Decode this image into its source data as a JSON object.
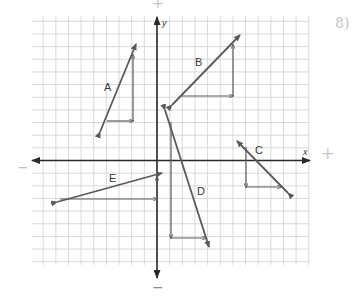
{
  "worksheet": {
    "grid": {
      "x_min": 32,
      "x_max": 309,
      "y_min": 16,
      "y_max": 265,
      "origin_px": [
        157,
        160.5
      ],
      "cell_px": 12.65,
      "color": "#cfcfcf"
    },
    "axes": {
      "x_label": "x",
      "y_label": "y",
      "color": "#2a2a2a"
    },
    "annotations": {
      "top_plus": "+",
      "bottom_minus": "−",
      "left_minus": "−",
      "right_plus": "+",
      "corner_mark": "8)"
    },
    "vectors": [
      {
        "label": "A",
        "from": [
          100,
          132
        ],
        "to": [
          136,
          44
        ],
        "triangle": [
          [
            107,
            121
          ],
          [
            133,
            121
          ],
          [
            133,
            55
          ]
        ],
        "label_pos": [
          104,
          82
        ]
      },
      {
        "label": "B",
        "from": [
          172,
          105
        ],
        "to": [
          240,
          35
        ],
        "triangle": [
          [
            180,
            96
          ],
          [
            233,
            96
          ],
          [
            233,
            45
          ]
        ],
        "label_pos": [
          195,
          57
        ]
      },
      {
        "label": "C",
        "from": [
          288,
          193
        ],
        "to": [
          237,
          141
        ],
        "triangle": [
          [
            246,
            147
          ],
          [
            246,
            187
          ],
          [
            281,
            187
          ]
        ],
        "label_pos": [
          255,
          145
        ]
      },
      {
        "label": "D",
        "from": [
          165,
          110
        ],
        "to": [
          209,
          247
        ],
        "triangle": [
          [
            171,
            122
          ],
          [
            171,
            238
          ],
          [
            206,
            238
          ]
        ],
        "label_pos": [
          197,
          186
        ]
      },
      {
        "label": "E",
        "from": [
          57,
          202
        ],
        "to": [
          162,
          173
        ],
        "triangle": [
          [
            60,
            199
          ],
          [
            157,
            199
          ],
          [
            157,
            177
          ]
        ],
        "label_pos": [
          109,
          173
        ]
      }
    ],
    "vector_color": "#5a5a5a"
  }
}
